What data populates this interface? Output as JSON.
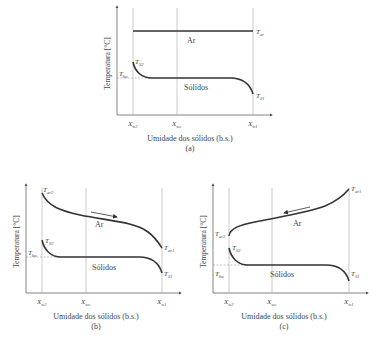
{
  "panels": [
    {
      "id": "a",
      "caption": "(a)",
      "xlabel": "Umidade dos sólidos (b.s.)",
      "ylabel": "Temperatura [°C]",
      "x_ticks": [
        {
          "base": "X",
          "sub": "w2"
        },
        {
          "base": "X",
          "sub": "wc"
        },
        {
          "base": "X",
          "sub": "w1"
        }
      ],
      "air_label": "Ar",
      "solids_label": "Sólidos",
      "air_curve": {
        "type": "constant",
        "end_label": {
          "base": "T",
          "sub": "ar"
        }
      },
      "solids_start": {
        "base": "T",
        "sub": "S2"
      },
      "solids_end": {
        "base": "T",
        "sub": "S1"
      },
      "wet_bulb": {
        "base": "T",
        "sub": "bu"
      }
    },
    {
      "id": "b",
      "caption": "(b)",
      "xlabel": "Umidade dos sólidos (b.s.)",
      "ylabel": "Temperatura [°C]",
      "x_ticks": [
        {
          "base": "X",
          "sub": "w2"
        },
        {
          "base": "X",
          "sub": "wc"
        },
        {
          "base": "X",
          "sub": "w1"
        }
      ],
      "air_label": "Ar",
      "solids_label": "Sólidos",
      "air_curve": {
        "type": "decreasing",
        "flow": "left-to-right",
        "start_label": {
          "base": "T",
          "sub": "ar2"
        },
        "end_label": {
          "base": "T",
          "sub": "ar1"
        }
      },
      "solids_start": {
        "base": "T",
        "sub": "S2"
      },
      "solids_end": {
        "base": "T",
        "sub": "S1"
      },
      "wet_bulb": {
        "base": "T",
        "sub": "bu"
      }
    },
    {
      "id": "c",
      "caption": "(c)",
      "xlabel": "Umidade dos sólidos (b.s.)",
      "ylabel": "Temperatura [°C]",
      "x_ticks": [
        {
          "base": "X",
          "sub": "w2"
        },
        {
          "base": "X",
          "sub": "wc"
        },
        {
          "base": "X",
          "sub": "w1"
        }
      ],
      "air_label": "Ar",
      "solids_label": "Sólidos",
      "air_curve": {
        "type": "increasing",
        "flow": "right-to-left",
        "start_label": {
          "base": "T",
          "sub": "ar2"
        },
        "end_label": {
          "base": "T",
          "sub": "ar1"
        }
      },
      "solids_start": {
        "base": "T",
        "sub": "S2"
      },
      "solids_end": {
        "base": "T",
        "sub": "S1"
      },
      "wet_bulb": {
        "base": "T",
        "sub": "bu"
      }
    }
  ]
}
